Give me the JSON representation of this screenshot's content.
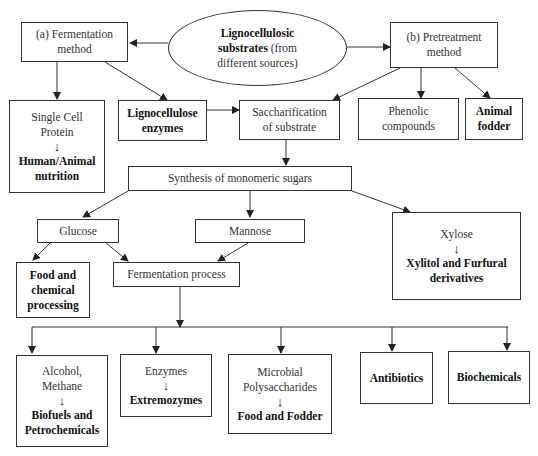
{
  "diagram": {
    "source_node": {
      "bold": "Lignocellulosic",
      "bold2": "substrates",
      "rest2": " (from",
      "line3": "different sources)"
    },
    "fermentation_method": {
      "line1": "(a) Fermentation",
      "line2": "method"
    },
    "pretreatment_method": {
      "line1": "(b) Pretreatment",
      "line2": "method"
    },
    "single_cell_protein": {
      "line1": "Single Cell",
      "line2": "Protein",
      "product1": "Human/Animal",
      "product2": "nutrition"
    },
    "lignocellulose_enzymes": {
      "line1": "Lignocellulose",
      "line2": "enzymes"
    },
    "saccharification": {
      "line1": "Saccharification",
      "line2": "of substrate"
    },
    "phenolic_compounds": {
      "line1": "Phenolic",
      "line2": "compounds"
    },
    "animal_fodder": {
      "line1": "Animal",
      "line2": "fodder"
    },
    "monomeric_sugars": {
      "label": "Synthesis of monomeric sugars"
    },
    "glucose": {
      "label": "Glucose"
    },
    "mannose": {
      "label": "Mannose"
    },
    "xylose": {
      "line1": "Xylose",
      "product1": "Xylitol and Furfural",
      "product2": "derivatives"
    },
    "food_chemical": {
      "line1": "Food and",
      "line2": "chemical",
      "line3": "processing"
    },
    "fermentation_process": {
      "label": "Fermentation process"
    },
    "alcohol_methane": {
      "line1": "Alcohol,",
      "line2": "Methane",
      "product1": "Biofuels and",
      "product2": "Petrochemicals"
    },
    "enzymes": {
      "line1": "Enzymes",
      "product1": "Extremozymes"
    },
    "microbial_polysaccharides": {
      "line1": "Microbial",
      "line2": "Polysaccharides",
      "product1": "Food and Fodder"
    },
    "antibiotics": {
      "label": "Antibiotics"
    },
    "biochemicals": {
      "label": "Biochemicals"
    },
    "arrow_glyph": "↓"
  },
  "colors": {
    "line": "#333333",
    "background": "#ffffff",
    "text": "#222222"
  }
}
